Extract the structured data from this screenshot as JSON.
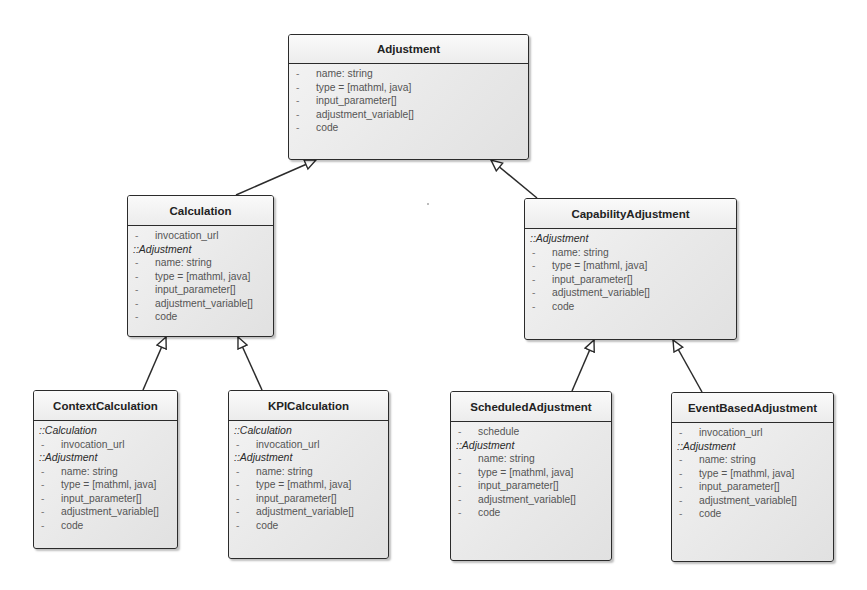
{
  "diagram": {
    "type": "uml-class-diagram",
    "classes": {
      "adjustment": {
        "name": "Adjustment",
        "sections": [
          {
            "title": "",
            "attributes": [
              {
                "vis": "-",
                "text": "name: string"
              },
              {
                "vis": "-",
                "text": "type = [mathml, java]"
              },
              {
                "vis": "-",
                "text": "input_parameter[]"
              },
              {
                "vis": "-",
                "text": "adjustment_variable[]"
              },
              {
                "vis": "-",
                "text": "code"
              }
            ]
          }
        ]
      },
      "calculation": {
        "name": "Calculation",
        "sections": [
          {
            "title": "",
            "attributes": [
              {
                "vis": "-",
                "text": "invocation_url"
              }
            ]
          },
          {
            "title": "::Adjustment",
            "attributes": [
              {
                "vis": "-",
                "text": "name: string"
              },
              {
                "vis": "-",
                "text": "type = [mathml, java]"
              },
              {
                "vis": "-",
                "text": "input_parameter[]"
              },
              {
                "vis": "-",
                "text": "adjustment_variable[]"
              },
              {
                "vis": "-",
                "text": "code"
              }
            ]
          }
        ]
      },
      "capability_adjustment": {
        "name": "CapabilityAdjustment",
        "sections": [
          {
            "title": "::Adjustment",
            "attributes": [
              {
                "vis": "-",
                "text": "name: string"
              },
              {
                "vis": "-",
                "text": "type = [mathml, java]"
              },
              {
                "vis": "-",
                "text": "input_parameter[]"
              },
              {
                "vis": "-",
                "text": "adjustment_variable[]"
              },
              {
                "vis": "-",
                "text": "code"
              }
            ]
          }
        ]
      },
      "context_calculation": {
        "name": "ContextCalculation",
        "sections": [
          {
            "title": "::Calculation",
            "attributes": [
              {
                "vis": "-",
                "text": "invocation_url"
              }
            ]
          },
          {
            "title": "::Adjustment",
            "attributes": [
              {
                "vis": "-",
                "text": "name: string"
              },
              {
                "vis": "-",
                "text": "type = [mathml, java]"
              },
              {
                "vis": "-",
                "text": "input_parameter[]"
              },
              {
                "vis": "-",
                "text": "adjustment_variable[]"
              },
              {
                "vis": "-",
                "text": "code"
              }
            ]
          }
        ]
      },
      "kpi_calculation": {
        "name": "KPICalculation",
        "sections": [
          {
            "title": "::Calculation",
            "attributes": [
              {
                "vis": "-",
                "text": "invocation_url"
              }
            ]
          },
          {
            "title": "::Adjustment",
            "attributes": [
              {
                "vis": "-",
                "text": "name: string"
              },
              {
                "vis": "-",
                "text": "type = [mathml, java]"
              },
              {
                "vis": "-",
                "text": "input_parameter[]"
              },
              {
                "vis": "-",
                "text": "adjustment_variable[]"
              },
              {
                "vis": "-",
                "text": "code"
              }
            ]
          }
        ]
      },
      "scheduled_adjustment": {
        "name": "ScheduledAdjustment",
        "sections": [
          {
            "title": "",
            "attributes": [
              {
                "vis": "-",
                "text": "schedule"
              }
            ]
          },
          {
            "title": "::Adjustment",
            "attributes": [
              {
                "vis": "-",
                "text": "name: string"
              },
              {
                "vis": "-",
                "text": "type = [mathml, java]"
              },
              {
                "vis": "-",
                "text": "input_parameter[]"
              },
              {
                "vis": "-",
                "text": "adjustment_variable[]"
              },
              {
                "vis": "-",
                "text": "code"
              }
            ]
          }
        ]
      },
      "event_based_adjustment": {
        "name": "EventBasedAdjustment",
        "sections": [
          {
            "title": "",
            "attributes": [
              {
                "vis": "-",
                "text": "invocation_url"
              }
            ]
          },
          {
            "title": "::Adjustment",
            "attributes": [
              {
                "vis": "-",
                "text": "name: string"
              },
              {
                "vis": "-",
                "text": "type = [mathml, java]"
              },
              {
                "vis": "-",
                "text": "input_parameter[]"
              },
              {
                "vis": "-",
                "text": "adjustment_variable[]"
              },
              {
                "vis": "-",
                "text": "code"
              }
            ]
          }
        ]
      }
    },
    "generalizations": [
      {
        "child": "Calculation",
        "parent": "Adjustment"
      },
      {
        "child": "CapabilityAdjustment",
        "parent": "Adjustment"
      },
      {
        "child": "ContextCalculation",
        "parent": "Calculation"
      },
      {
        "child": "KPICalculation",
        "parent": "Calculation"
      },
      {
        "child": "ScheduledAdjustment",
        "parent": "CapabilityAdjustment"
      },
      {
        "child": "EventBasedAdjustment",
        "parent": "CapabilityAdjustment"
      }
    ],
    "colors": {
      "border": "#2b2b2b",
      "fill": "#ececec",
      "attribute_text": "#555555",
      "title_text": "#222222"
    }
  }
}
